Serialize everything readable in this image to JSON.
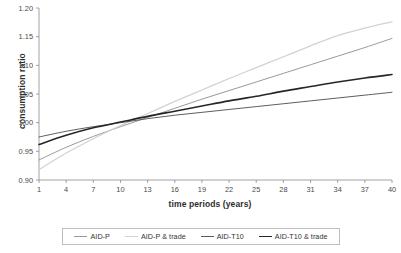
{
  "chart_data": {
    "type": "line",
    "title": "",
    "xlabel": "time periods (years)",
    "ylabel": "consumption ratio",
    "xlim": [
      1,
      40
    ],
    "ylim": [
      0.9,
      1.2
    ],
    "grid": false,
    "legend_position": "bottom",
    "xticks": [
      "1",
      "4",
      "7",
      "10",
      "13",
      "16",
      "19",
      "22",
      "25",
      "28",
      "31",
      "34",
      "37",
      "40"
    ],
    "xtick_values": [
      1,
      4,
      7,
      10,
      13,
      16,
      19,
      22,
      25,
      28,
      31,
      34,
      37,
      40
    ],
    "yticks": [
      "0.90",
      "0.95",
      "1.00",
      "1.05",
      "1.10",
      "1.15",
      "1.20"
    ],
    "ytick_values": [
      0.9,
      0.95,
      1.0,
      1.05,
      1.1,
      1.15,
      1.2
    ],
    "x": [
      1,
      4,
      7,
      10,
      13,
      16,
      19,
      22,
      25,
      28,
      31,
      34,
      37,
      40
    ],
    "series": [
      {
        "name": "AID-P",
        "color": "#9a9a9a",
        "width": 1.0,
        "values": [
          0.935,
          0.957,
          0.976,
          0.993,
          1.009,
          1.025,
          1.041,
          1.056,
          1.071,
          1.086,
          1.101,
          1.116,
          1.131,
          1.147
        ]
      },
      {
        "name": "AID-P & trade",
        "color": "#d2d2d2",
        "width": 1.3,
        "values": [
          0.918,
          0.947,
          0.972,
          0.995,
          1.016,
          1.037,
          1.057,
          1.077,
          1.096,
          1.115,
          1.134,
          1.152,
          1.165,
          1.176
        ]
      },
      {
        "name": "AID-T10",
        "color": "#5e5e5e",
        "width": 1.0,
        "values": [
          0.975,
          0.985,
          0.993,
          1.0,
          1.007,
          1.013,
          1.018,
          1.023,
          1.028,
          1.033,
          1.038,
          1.043,
          1.048,
          1.053
        ]
      },
      {
        "name": "AID-T10 & trade",
        "color": "#262626",
        "width": 1.6,
        "values": [
          0.962,
          0.978,
          0.991,
          1.001,
          1.011,
          1.02,
          1.029,
          1.038,
          1.046,
          1.055,
          1.063,
          1.071,
          1.078,
          1.084
        ]
      }
    ]
  },
  "legend": {
    "items": [
      {
        "label": "AID-P"
      },
      {
        "label": "AID-P & trade"
      },
      {
        "label": "AID-T10"
      },
      {
        "label": "AID-T10 & trade"
      }
    ]
  }
}
